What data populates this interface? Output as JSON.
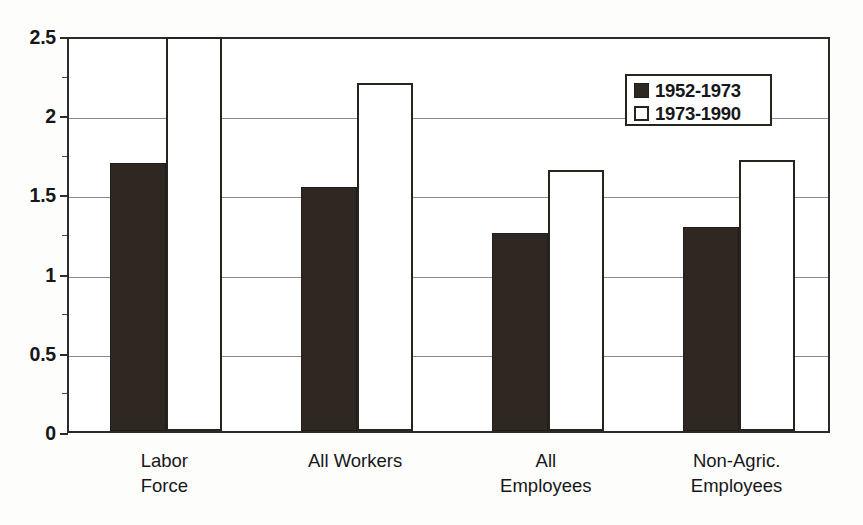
{
  "chart_data": {
    "type": "bar",
    "title": "",
    "subtitle": "",
    "xlabel": "",
    "ylabel": "",
    "ylim": [
      0,
      2.5
    ],
    "yticks": [
      "0",
      "0.5",
      "1",
      "1.5",
      "2",
      "2.5"
    ],
    "ytick_values": [
      0,
      0.5,
      1,
      1.5,
      2,
      2.5
    ],
    "grid": true,
    "legend_position": "upper right",
    "categories": [
      "Labor\nForce",
      "All Workers",
      "All\nEmployees",
      "Non-Agric.\nEmployees"
    ],
    "category_lines": [
      [
        "Labor",
        "Force"
      ],
      [
        "All Workers"
      ],
      [
        "All",
        "Employees"
      ],
      [
        "Non-Agric.",
        "Employees"
      ]
    ],
    "series": [
      {
        "name": "1952-1973",
        "color": "#2e2722",
        "style": "filled",
        "values": [
          1.69,
          1.54,
          1.25,
          1.29
        ]
      },
      {
        "name": "1973-1990",
        "color": "#ffffff",
        "style": "outlined",
        "values": [
          2.49,
          2.2,
          1.65,
          1.71
        ]
      }
    ],
    "annotations": []
  },
  "legend": {
    "entries": [
      {
        "label": "1952-1973",
        "swatch": "filled-dark-square"
      },
      {
        "label": "1973-1990",
        "swatch": "outlined-white-square"
      }
    ]
  },
  "axes": {
    "frame_color": "#2b2b28",
    "gridline_color": "#8b8b85",
    "text_color": "#17171a"
  }
}
